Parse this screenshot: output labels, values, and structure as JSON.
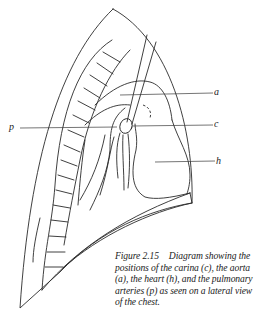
{
  "figure": {
    "number": "Figure 2.15",
    "caption": "Diagram showing the positions of the carina (c), the aorta (a), the heart (h), and the pulmonary arteries (p) as seen on a lateral view of the chest.",
    "caption_lines": [
      "Diagram showing the",
      "positions of the carina (c), the aorta",
      "(a), the heart (h), and the pulmonary",
      "arteries (p) as seen on a lateral view",
      "of the chest."
    ]
  },
  "labels": {
    "a": "a",
    "c": "c",
    "h": "h",
    "p": "p"
  },
  "structures": {
    "a": "aorta",
    "c": "carina",
    "h": "heart",
    "p": "pulmonary arteries"
  },
  "colors": {
    "line": "#2a2a2a",
    "text": "#222222",
    "background": "#ffffff"
  }
}
